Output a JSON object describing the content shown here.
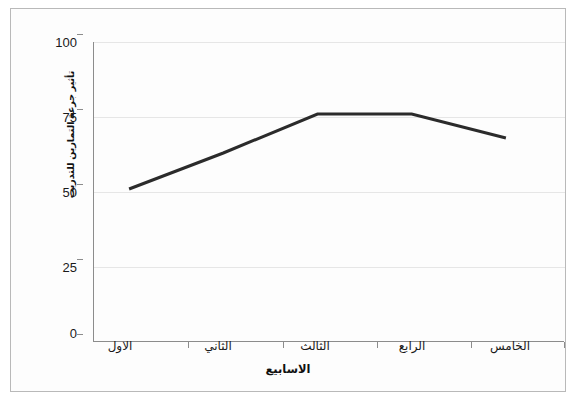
{
  "figure": {
    "background_color": "#ffffff",
    "frame_color": "#b9b9b9",
    "axis_color": "#8c8c8c",
    "grid_color": "#e6e6e6",
    "series_color": "#2b2b2b"
  },
  "axes": {
    "x_title": "الاسابيع",
    "y_title": "تأثير جرعة التمارين للتدريب"
  },
  "ticks": {
    "y": [
      "0",
      "25",
      "50",
      "75",
      "100"
    ],
    "x": [
      "الاول",
      "الثاني",
      "الثالث",
      "الرابع",
      "الخامس"
    ]
  },
  "chart_data": {
    "type": "line",
    "title": "",
    "subtitle": "",
    "xlabel": "الاسابيع",
    "ylabel": "تأثير جرعة التمارين للتدريب",
    "categories": [
      "الاول",
      "الثاني",
      "الثالث",
      "الرابع",
      "الخامس"
    ],
    "categories_en": [
      "First",
      "Second",
      "Third",
      "Fourth",
      "Fifth"
    ],
    "values": [
      48,
      60,
      73,
      73,
      65
    ],
    "series": [
      {
        "name": "",
        "values": [
          48,
          60,
          73,
          73,
          65
        ],
        "color": "#2b2b2b",
        "line_width": 3,
        "markers": false
      }
    ],
    "ylim": [
      0,
      100
    ],
    "yticks": [
      0,
      25,
      50,
      75,
      100
    ],
    "grid": true,
    "grid_axis": "y",
    "legend": false,
    "legend_position": "none",
    "annotations": []
  }
}
